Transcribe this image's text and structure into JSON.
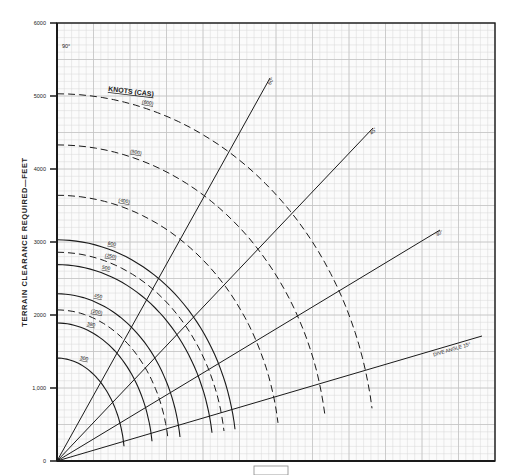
{
  "chart_data": {
    "type": "line",
    "title": "",
    "xlabel": "",
    "ylabel": "TERRAIN CLEARANCE REQUIRED—FEET",
    "ylim": [
      0,
      6000
    ],
    "y_ticks": [
      "0",
      "1,000",
      "2000",
      "3000",
      "4000",
      "5000",
      "6000"
    ],
    "grid": true,
    "legend_title": "KNOTS (CAS)",
    "corner_label": "90°",
    "dive_angles": [
      {
        "label": "60°",
        "angle": 60
      },
      {
        "label": "45°",
        "angle": 45
      },
      {
        "label": "30°",
        "angle": 30
      },
      {
        "label": "DIVE ANGLE   15°",
        "angle": 15
      }
    ],
    "series": [
      {
        "name": "(600)",
        "style": "dashed",
        "clearance_at_90": 5030,
        "end_x_px": 372
      },
      {
        "name": "(500)",
        "style": "dashed",
        "clearance_at_90": 4330,
        "end_x_px": 325
      },
      {
        "name": "(400)",
        "style": "dashed",
        "clearance_at_90": 3640,
        "end_x_px": 278
      },
      {
        "name": "600",
        "style": "solid",
        "clearance_at_90": 3030,
        "end_x_px": 235
      },
      {
        "name": "(250)",
        "style": "dashed",
        "clearance_at_90": 2860,
        "end_x_px": 224
      },
      {
        "name": "500",
        "style": "solid",
        "clearance_at_90": 2690,
        "end_x_px": 212
      },
      {
        "name": "450",
        "style": "solid",
        "clearance_at_90": 2290,
        "end_x_px": 180
      },
      {
        "name": "(200)",
        "style": "dashed",
        "clearance_at_90": 2070,
        "end_x_px": 168
      },
      {
        "name": "380",
        "style": "solid",
        "clearance_at_90": 1890,
        "end_x_px": 152
      },
      {
        "name": "300",
        "style": "solid",
        "clearance_at_90": 1410,
        "end_x_px": 124
      }
    ]
  },
  "colors": {
    "ink": "#1a1a1a",
    "grid": "#d9d9d9",
    "paper": "#fbfbfb"
  }
}
